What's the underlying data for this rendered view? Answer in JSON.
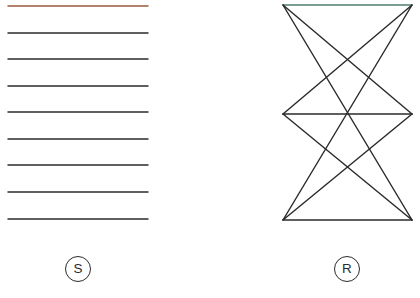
{
  "figure": {
    "width": 420,
    "height": 298,
    "background": "#ffffff",
    "default_stroke": "#262626",
    "default_stroke_width": 1.45
  },
  "panels": [
    {
      "id": "panel-s",
      "caption_label": "S",
      "caption_name": "panel-caption-s",
      "caption_shape": "circle",
      "caption_cx": 78,
      "caption_cy": 269,
      "caption_r": 13,
      "description": "Nine evenly spaced horizontal parallel line segments",
      "line_count": 9,
      "x_start": 8,
      "x_end": 148,
      "line_spacing": 26.5,
      "lines": [
        {
          "index": 1,
          "y": 6,
          "color": "#9c5840",
          "width": 1.5
        },
        {
          "index": 2,
          "y": 33,
          "color": "#2b2b2b",
          "width": 1.45
        },
        {
          "index": 3,
          "y": 59,
          "color": "#2b2b2b",
          "width": 1.45
        },
        {
          "index": 4,
          "y": 86,
          "color": "#2b2b2b",
          "width": 1.45
        },
        {
          "index": 5,
          "y": 112,
          "color": "#2b2b2b",
          "width": 1.45
        },
        {
          "index": 6,
          "y": 139,
          "color": "#2b2b2b",
          "width": 1.45
        },
        {
          "index": 7,
          "y": 165,
          "color": "#2b2b2b",
          "width": 1.45
        },
        {
          "index": 8,
          "y": 192,
          "color": "#2b2b2b",
          "width": 1.45
        },
        {
          "index": 9,
          "y": 219,
          "color": "#2b2b2b",
          "width": 1.45
        }
      ]
    },
    {
      "id": "panel-r",
      "caption_label": "R",
      "caption_name": "panel-caption-r",
      "caption_shape": "circle",
      "caption_cx": 347,
      "caption_cy": 269,
      "caption_r": 13,
      "description": "Stacked bowtie lattice: three horizontal rails joined by crossing diagonals",
      "nodes": [
        {
          "name": "top-left",
          "x": 283,
          "y": 5
        },
        {
          "name": "top-right",
          "x": 412,
          "y": 5
        },
        {
          "name": "middle-left",
          "x": 283,
          "y": 114
        },
        {
          "name": "middle-right",
          "x": 412,
          "y": 114
        },
        {
          "name": "bottom-left",
          "x": 283,
          "y": 220
        },
        {
          "name": "bottom-right",
          "x": 412,
          "y": 220
        }
      ],
      "edges": [
        {
          "name": "top-rail",
          "from": "top-left",
          "to": "top-right",
          "color": "#4f7f72",
          "width": 1.5
        },
        {
          "name": "middle-rail",
          "from": "middle-left",
          "to": "middle-right",
          "color": "#2b2b2b",
          "width": 1.45
        },
        {
          "name": "bottom-rail",
          "from": "bottom-left",
          "to": "bottom-right",
          "color": "#2b2b2b",
          "width": 1.45
        },
        {
          "name": "upper-diag-a",
          "from": "top-left",
          "to": "middle-right",
          "color": "#2b2b2b",
          "width": 1.45
        },
        {
          "name": "upper-diag-b",
          "from": "top-right",
          "to": "middle-left",
          "color": "#2b2b2b",
          "width": 1.45
        },
        {
          "name": "lower-diag-a",
          "from": "middle-left",
          "to": "bottom-right",
          "color": "#2b2b2b",
          "width": 1.45
        },
        {
          "name": "lower-diag-b",
          "from": "middle-right",
          "to": "bottom-left",
          "color": "#2b2b2b",
          "width": 1.45
        },
        {
          "name": "long-diag-a",
          "from": "top-left",
          "to": "bottom-right",
          "color": "#2b2b2b",
          "width": 1.45
        },
        {
          "name": "long-diag-b",
          "from": "top-right",
          "to": "bottom-left",
          "color": "#2b2b2b",
          "width": 1.45
        }
      ]
    }
  ]
}
